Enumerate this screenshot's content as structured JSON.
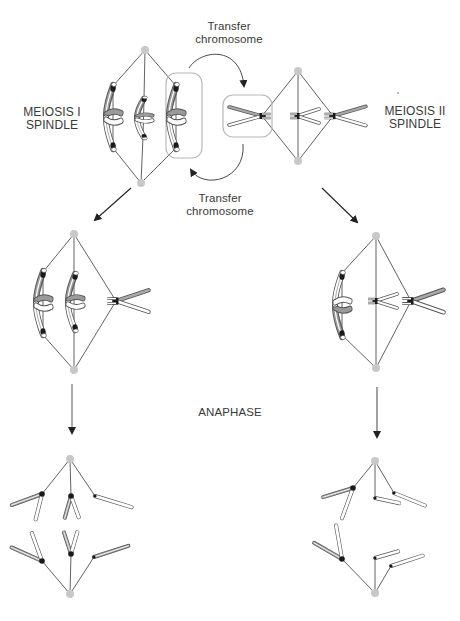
{
  "labels": {
    "meiosis1": {
      "line1": "MEIOSIS I",
      "line2": "SPINDLE"
    },
    "meiosis2": {
      "line1": "MEIOSIS II",
      "line2": "SPINDLE"
    },
    "transfer_top": {
      "line1": "Transfer",
      "line2": "chromosome"
    },
    "transfer_bottom": {
      "line1": "Transfer",
      "line2": "chromosome"
    },
    "anaphase": "ANAPHASE"
  },
  "colors": {
    "spindle_line": "#3a3a3a",
    "pole": "#c8c8c8",
    "kinetochore": "#1a1a1a",
    "chromatid_gray": "#9a9a9a",
    "chromatid_white": "#ffffff",
    "box_outline": "#b8b8b8",
    "arrow": "#222222",
    "text": "#3a3a3a"
  },
  "panels": [
    {
      "id": "meiosis-I-spindle",
      "position": "top-left"
    },
    {
      "id": "meiosis-II-spindle",
      "position": "top-right"
    },
    {
      "id": "meiosis-I-after-transfer",
      "position": "middle-left"
    },
    {
      "id": "meiosis-II-after-transfer",
      "position": "middle-right"
    },
    {
      "id": "anaphase-I",
      "position": "bottom-left"
    },
    {
      "id": "anaphase-II",
      "position": "bottom-right"
    }
  ]
}
